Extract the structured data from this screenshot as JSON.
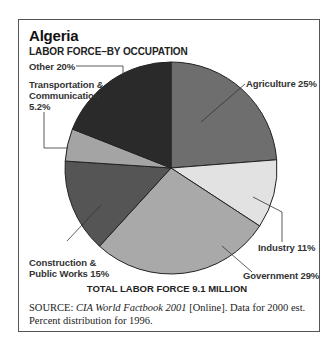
{
  "title": "Algeria",
  "subtitle": "LABOR FORCE–BY OCCUPATION",
  "total_label": "TOTAL LABOR FORCE 9.1 MILLION",
  "source": {
    "prefix": "SOURCE:",
    "italic": "CIA World Factbook 2001",
    "rest": " [Online]. Data for 2000 est. Percent distribution for 1996."
  },
  "labels": {
    "other": "Other 20%",
    "transport_1": "Transportation &",
    "transport_2": "Communication",
    "transport_3": "5.2%",
    "agriculture": "Agriculture 25%",
    "industry": "Industry 11%",
    "government": "Government 29%",
    "construction_1": "Construction &",
    "construction_2": "Public Works 15%"
  },
  "chart_data": {
    "type": "pie",
    "subtitle": "LABOR FORCE–BY OCCUPATION",
    "categories": [
      "Agriculture",
      "Industry",
      "Government",
      "Construction & Public Works",
      "Transportation & Communication",
      "Other"
    ],
    "values": [
      25,
      11,
      29,
      15,
      5.2,
      20
    ],
    "unit": "%",
    "colors": [
      "#6e6e6e",
      "#e2e2e2",
      "#a9a9a9",
      "#555555",
      "#a4a4a4",
      "#2a2a2a"
    ],
    "start_angle": "12 o'clock, clockwise",
    "annotation": "TOTAL LABOR FORCE 9.1 MILLION",
    "legend": "none (direct labels with leader lines)"
  }
}
